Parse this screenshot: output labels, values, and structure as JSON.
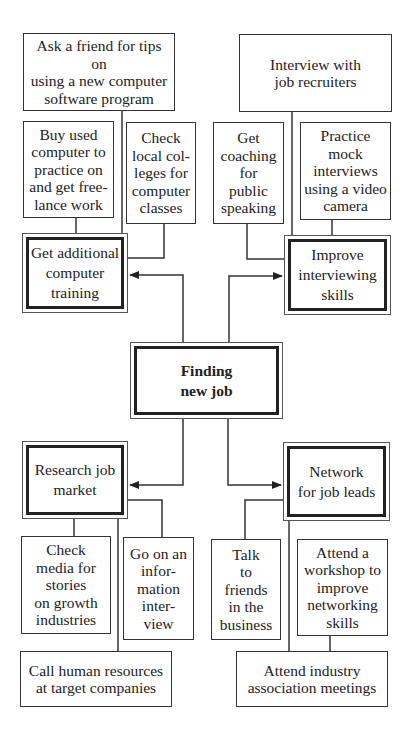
{
  "diagram": {
    "center": {
      "label": "Finding\nnew job"
    },
    "branches": [
      {
        "label": "Get additional\ncomputer\ntraining",
        "items": [
          "Ask a friend for tips on\nusing a new computer\nsoftware program",
          "Buy used\ncomputer to\npractice on\nand get free-\nlance work",
          "Check\nlocal col-\nleges for\ncomputer\nclasses"
        ]
      },
      {
        "label": "Improve\ninterviewing\nskills",
        "items": [
          "Interview with\njob recruiters",
          "Get\ncoaching\nfor\npublic\nspeaking",
          "Practice\nmock\ninterviews\nusing a video\ncamera"
        ]
      },
      {
        "label": "Research job\nmarket",
        "items": [
          "Check\nmedia for\nstories\non growth\nindustries",
          "Go on an\ninfor-\nmation\ninter-\nview",
          "Call human resources\nat target companies"
        ]
      },
      {
        "label": "Network\nfor job leads",
        "items": [
          "Talk\nto\nfriends\nin the\nbusiness",
          "Attend a\nworkshop to\nimprove\nnetworking\nskills",
          "Attend industry\nassociation meetings"
        ]
      }
    ]
  }
}
